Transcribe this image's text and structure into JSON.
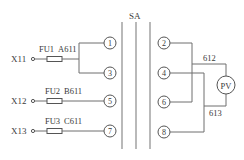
{
  "diagram": {
    "switch_label": "SA",
    "inputs": [
      {
        "terminal": "X11",
        "fuse": "FU1",
        "wire": "A611"
      },
      {
        "terminal": "X12",
        "fuse": "FU2",
        "wire": "B611"
      },
      {
        "terminal": "X13",
        "fuse": "FU3",
        "wire": "C611"
      }
    ],
    "left_contacts": [
      "1",
      "3",
      "5",
      "7"
    ],
    "right_contacts": [
      "2",
      "4",
      "6",
      "8"
    ],
    "meter_label": "PV",
    "wire_labels": {
      "top": "612",
      "bottom": "613"
    }
  },
  "colors": {
    "line": "#6e6e6e",
    "text": "#3a3a3a",
    "background": "#ffffff"
  }
}
